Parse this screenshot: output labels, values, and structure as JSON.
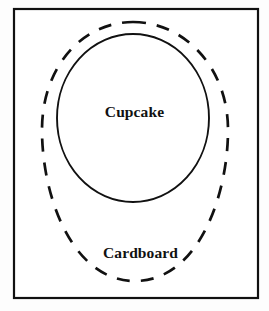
{
  "figure": {
    "background_color": "#fdfdfd",
    "stroke_color": "#111111",
    "frame": {
      "name": "outer-frame",
      "x": 14,
      "y": 9,
      "width": 244,
      "height": 289,
      "stroke_width": 2.2,
      "fill": "#ffffff"
    },
    "shapes": [
      {
        "name": "cardboard-outline",
        "style": "dashed",
        "label": "Cardboard",
        "center_x": 135,
        "center_y": 152,
        "radius_x": 93,
        "radius_y": 130,
        "stroke_width": 2.6,
        "dash_pattern": "13 11"
      },
      {
        "name": "cupcake-outline",
        "style": "solid",
        "label": "Cupcake",
        "center_x": 133,
        "center_y": 118,
        "radius_x": 76,
        "radius_y": 84,
        "stroke_width": 1.8
      }
    ],
    "labels": {
      "cupcake": "Cupcake",
      "cardboard": "Cardboard"
    }
  }
}
